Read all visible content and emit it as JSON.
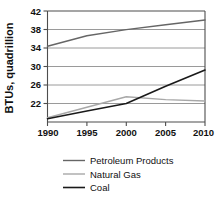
{
  "chart_data": {
    "type": "line",
    "title": "",
    "xlabel": "",
    "ylabel": "BTUs, quadrillion",
    "x": [
      1990,
      1995,
      2000,
      2005,
      2010
    ],
    "xlim": [
      1990,
      2010
    ],
    "ylim": [
      18.7,
      42
    ],
    "yticks": [
      22,
      26,
      30,
      34,
      38,
      42
    ],
    "xticks": [
      1990,
      1995,
      2000,
      2005,
      2010
    ],
    "grid": true,
    "legend_position": "bottom",
    "series": [
      {
        "name": "Petroleum Products",
        "color": "#666666",
        "values": [
          34.6,
          36.8,
          38.1,
          39.1,
          40.1
        ]
      },
      {
        "name": "Natural Gas",
        "color": "#a8a8a8",
        "values": [
          19.6,
          21.8,
          24.0,
          23.4,
          23.1
        ]
      },
      {
        "name": "Coal",
        "color": "#1a1a1a",
        "values": [
          19.4,
          21.0,
          22.6,
          26.2,
          29.6
        ]
      }
    ]
  },
  "axis": {
    "ytick_labels": [
      "22",
      "26",
      "30",
      "34",
      "38",
      "42"
    ],
    "xtick_labels": [
      "1990",
      "1995",
      "2000",
      "2005",
      "2010"
    ],
    "ylabel": "BTUs, quadrillion"
  },
  "legend": {
    "items": [
      {
        "label": "Petroleum Products",
        "color": "#666666"
      },
      {
        "label": "Natural Gas",
        "color": "#a8a8a8"
      },
      {
        "label": "Coal",
        "color": "#1a1a1a"
      }
    ]
  },
  "colors": {
    "axis": "#4d4d4d",
    "grid": "#808080",
    "text": "#111111",
    "background": "#ffffff"
  }
}
